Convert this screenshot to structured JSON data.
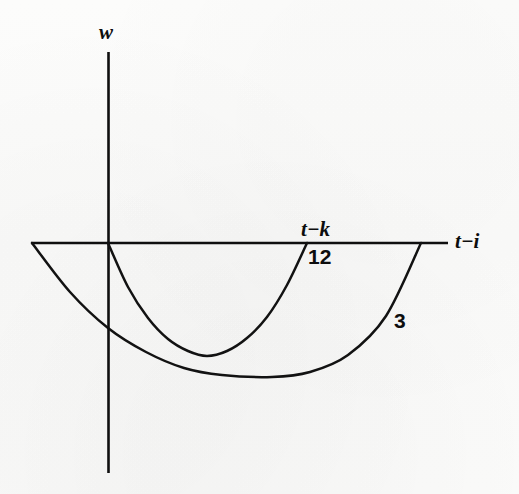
{
  "figure": {
    "kind": "line-plot",
    "background_color": "#fbfbfa",
    "ink_color": "#0f0f0f",
    "axes": {
      "vertical_axis_label": "w",
      "horizontal_axis_label": "t−i",
      "tick_label": "t−k"
    },
    "curve_labels": {
      "inner": "12",
      "outer": "3"
    }
  },
  "chart_data": {
    "type": "line",
    "title": "",
    "subtitle": "",
    "xlabel": "t−i",
    "ylabel": "w",
    "grid": false,
    "legend_position": "inline-annotations",
    "annotations": [
      {
        "text": "w",
        "role": "y-axis-label",
        "style": "italic-bold",
        "x": 108,
        "y": 30
      },
      {
        "text": "t−k",
        "role": "x-tick-label",
        "style": "italic-bold",
        "x": 305,
        "y": 229
      },
      {
        "text": "12",
        "role": "curve-label",
        "style": "upright-bold",
        "x": 312,
        "y": 256
      },
      {
        "text": "t−i",
        "role": "x-axis-label",
        "style": "italic-bold",
        "x": 460,
        "y": 243
      },
      {
        "text": "3",
        "role": "curve-label",
        "style": "upright-bold",
        "x": 398,
        "y": 322
      }
    ],
    "axis_ranges": {
      "x_pixel_span": [
        31,
        448
      ],
      "y_pixel_span": [
        52,
        473
      ],
      "origin_pixel": [
        108,
        243
      ],
      "x_zero_line_pixel_y": 243
    },
    "series": [
      {
        "name": "12",
        "description": "inner downward-opening weight lobe, zero at origin and at t-k",
        "type": "parabola",
        "zeros_pixel_x": [
          108,
          307
        ],
        "vertex_pixel": [
          207,
          356
        ],
        "points_pixel": [
          [
            108,
            243
          ],
          [
            128,
            287
          ],
          [
            148,
            318
          ],
          [
            168,
            339
          ],
          [
            188,
            351
          ],
          [
            207,
            356
          ],
          [
            227,
            351
          ],
          [
            247,
            338
          ],
          [
            267,
            317
          ],
          [
            287,
            285
          ],
          [
            307,
            243
          ]
        ]
      },
      {
        "name": "3",
        "description": "outer wider downward-opening weight lobe, zero at left axis start and right of t-k",
        "type": "parabola",
        "zeros_pixel_x": [
          32,
          421
        ],
        "vertex_pixel": [
          272,
          377
        ],
        "points_pixel": [
          [
            32,
            243
          ],
          [
            70,
            292
          ],
          [
            108,
            328
          ],
          [
            146,
            352
          ],
          [
            184,
            368
          ],
          [
            222,
            375
          ],
          [
            272,
            377
          ],
          [
            310,
            372
          ],
          [
            348,
            355
          ],
          [
            386,
            316
          ],
          [
            421,
            243
          ]
        ]
      }
    ]
  }
}
